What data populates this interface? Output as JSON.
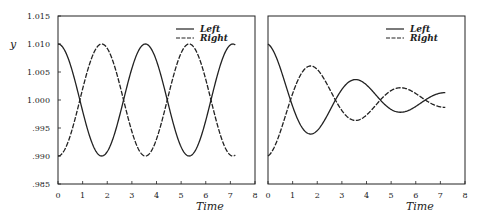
{
  "chart_data": [
    {
      "type": "line",
      "title": "",
      "xlabel": "Time",
      "ylabel": "y",
      "xlim": [
        0,
        8
      ],
      "ylim": [
        0.985,
        1.015
      ],
      "xticks": [
        "0",
        "1",
        "2",
        "3",
        "4",
        "5",
        "6",
        "7",
        "8"
      ],
      "yticks": [
        "1.015",
        "1.010",
        "1.005",
        "1.000",
        ".995",
        ".990",
        ".985"
      ],
      "grid": false,
      "legend": {
        "position": "upper right",
        "entries": [
          "Left",
          "Right"
        ]
      },
      "series": [
        {
          "name": "Left",
          "style": "solid",
          "x": [
            0,
            0.88,
            1.77,
            2.65,
            3.55,
            4.42,
            5.3,
            6.2,
            7.2
          ],
          "y": [
            1.01,
            1.0,
            0.99,
            1.0,
            1.01,
            1.0,
            0.99,
            1.0,
            1.0097
          ]
        },
        {
          "name": "Right",
          "style": "dashed",
          "x": [
            0,
            0.88,
            1.77,
            2.65,
            3.55,
            4.42,
            5.3,
            6.2,
            7.2
          ],
          "y": [
            0.99,
            1.0,
            1.01,
            1.0,
            0.99,
            1.0,
            1.01,
            1.0,
            0.9903
          ]
        }
      ],
      "model": {
        "amplitude": 0.01,
        "period": 3.55,
        "damping": 0,
        "t_end": 7.2
      }
    },
    {
      "type": "line",
      "title": "",
      "xlabel": "Time",
      "ylabel": "",
      "xlim": [
        0,
        8
      ],
      "ylim": [
        0.985,
        1.015
      ],
      "xticks": [
        "0",
        "1",
        "2",
        "3",
        "4",
        "5",
        "6",
        "7",
        "8"
      ],
      "yticks": [],
      "grid": false,
      "legend": {
        "position": "upper right",
        "entries": [
          "Left",
          "Right"
        ]
      },
      "series": [
        {
          "name": "Left",
          "style": "solid",
          "x": [
            0,
            1.0,
            1.85,
            2.8,
            3.7,
            4.6,
            5.5,
            6.5,
            7.2
          ],
          "y": [
            1.01,
            1.0,
            0.994,
            1.0,
            1.0035,
            1.0,
            0.998,
            1.0,
            1.001
          ]
        },
        {
          "name": "Right",
          "style": "dashed",
          "x": [
            0,
            1.0,
            1.85,
            2.8,
            3.7,
            4.6,
            5.5,
            6.5,
            7.2
          ],
          "y": [
            0.99,
            1.0,
            1.006,
            1.0,
            0.9965,
            1.0,
            1.002,
            1.0,
            0.999
          ]
        }
      ],
      "model": {
        "amplitude": 0.01,
        "period": 3.65,
        "damping": 0.28,
        "t_end": 7.2
      }
    }
  ],
  "labels": {
    "ylabel": "y",
    "xlabel_left": "Time",
    "xlabel_right": "Time",
    "legend_left": "Left",
    "legend_right": "Right"
  }
}
